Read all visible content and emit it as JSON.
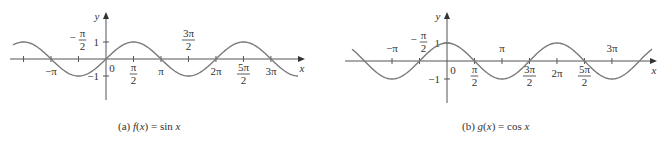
{
  "chart_data": [
    {
      "type": "line",
      "title": "",
      "caption": {
        "prefix": "(a) ",
        "func": "f",
        "arg": "(x)",
        "eq": " = sin ",
        "var": "x"
      },
      "function": "sin",
      "xlabel": "x",
      "ylabel": "y",
      "x_range": [
        -5.6,
        11.5
      ],
      "y_range": [
        -1,
        1
      ],
      "y_ticks": [
        {
          "value": 1,
          "label": "1"
        },
        {
          "value": -1,
          "label": "−1"
        }
      ],
      "origin_label": "0",
      "x_ticks": [
        {
          "value": -4.712,
          "label": "",
          "pos": "none"
        },
        {
          "value": -3.1416,
          "label": "−π",
          "pos": "below"
        },
        {
          "value": -1.5708,
          "label": "−π/2",
          "pos": "above"
        },
        {
          "value": 1.5708,
          "label": "π/2",
          "pos": "below"
        },
        {
          "value": 3.1416,
          "label": "π",
          "pos": "below"
        },
        {
          "value": 4.712,
          "label": "3π/2",
          "pos": "above"
        },
        {
          "value": 6.2832,
          "label": "2π",
          "pos": "below"
        },
        {
          "value": 7.854,
          "label": "5π/2",
          "pos": "below"
        },
        {
          "value": 9.4248,
          "label": "3π",
          "pos": "below"
        }
      ],
      "grid": false,
      "legend": "none"
    },
    {
      "type": "line",
      "title": "",
      "caption": {
        "prefix": "(b) ",
        "func": "g",
        "arg": "(x)",
        "eq": " = cos ",
        "var": "x"
      },
      "function": "cos",
      "xlabel": "x",
      "ylabel": "y",
      "x_range": [
        -5.3,
        11.2
      ],
      "y_range": [
        -1,
        1
      ],
      "y_ticks": [
        {
          "value": 1,
          "label": "1"
        },
        {
          "value": -1,
          "label": "−1"
        }
      ],
      "origin_label": "0",
      "x_ticks": [
        {
          "value": -3.1416,
          "label": "−π",
          "pos": "above"
        },
        {
          "value": -1.5708,
          "label": "−π/2",
          "pos": "above"
        },
        {
          "value": 1.5708,
          "label": "π/2",
          "pos": "below"
        },
        {
          "value": 3.1416,
          "label": "π",
          "pos": "above"
        },
        {
          "value": 4.712,
          "label": "3π/2",
          "pos": "below"
        },
        {
          "value": 6.2832,
          "label": "2π",
          "pos": "below"
        },
        {
          "value": 7.854,
          "label": "5π/2",
          "pos": "below"
        },
        {
          "value": 9.4248,
          "label": "3π",
          "pos": "above"
        }
      ],
      "grid": false,
      "legend": "none"
    }
  ],
  "layout": {
    "charts": [
      {
        "origin_x": 106,
        "origin_y": 59,
        "px_per_unit_x": 17.5,
        "amp_px": 17,
        "axis_x_start": 10,
        "axis_x_end": 305,
        "axis_y_top": 12,
        "axis_y_bottom": 100,
        "curve_x_start": 13,
        "curve_x_end": 298,
        "caption_left": 118
      },
      {
        "origin_x": 447,
        "origin_y": 61,
        "px_per_unit_x": 17.5,
        "amp_px": 18,
        "axis_x_start": 345,
        "axis_x_end": 657,
        "axis_y_top": 12,
        "axis_y_bottom": 103,
        "curve_x_start": 352,
        "curve_x_end": 652,
        "caption_left": 462
      }
    ],
    "stroke_color": "#7a7a7a",
    "axis_color": "#555555"
  }
}
